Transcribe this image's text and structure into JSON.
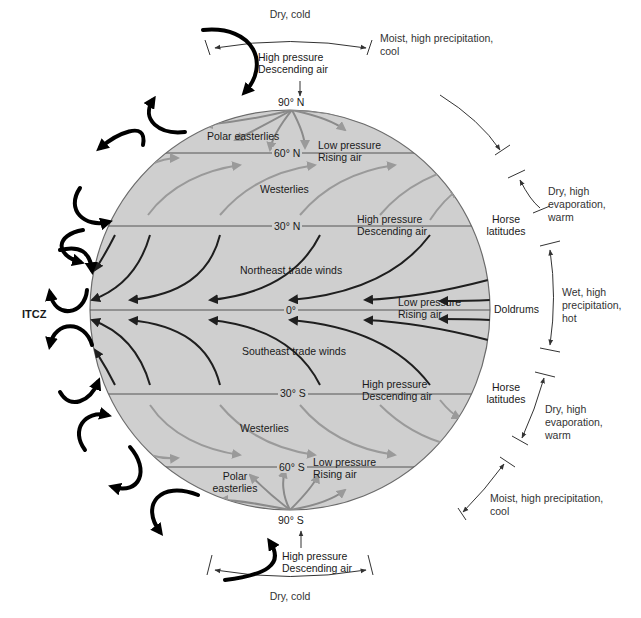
{
  "diagram": {
    "colors": {
      "globe_fill": "#cfcfcf",
      "globe_stroke": "#6b6b6b",
      "trade_wind_arrow": "#1f1f1f",
      "westerly_arrow": "#9a9a9a",
      "cell_arrow": "#000000",
      "background": "#ffffff"
    },
    "latitudes": [
      {
        "id": "90N",
        "label": "90° N"
      },
      {
        "id": "60N",
        "label": "60° N"
      },
      {
        "id": "30N",
        "label": "30° N"
      },
      {
        "id": "eq",
        "label": "0°"
      },
      {
        "id": "30S",
        "label": "30° S"
      },
      {
        "id": "60S",
        "label": "60° S"
      },
      {
        "id": "90S",
        "label": "90° S"
      }
    ],
    "pressure_labels": {
      "north_pole": {
        "line1": "High pressure",
        "line2": "Descending air"
      },
      "n60": {
        "line1": "Low pressure",
        "line2": "Rising air"
      },
      "n30": {
        "line1": "High pressure",
        "line2": "Descending air"
      },
      "equator": {
        "line1": "Low pressure",
        "line2": "Rising air"
      },
      "s30": {
        "line1": "High pressure",
        "line2": "Descending air"
      },
      "s60": {
        "line1": "Low pressure",
        "line2": "Rising air"
      },
      "south_pole": {
        "line1": "High pressure",
        "line2": "Descending air"
      }
    },
    "wind_labels": {
      "polar_easterlies_north": "Polar easterlies",
      "westerlies_north": "Westerlies",
      "ne_trades": "Northeast trade winds",
      "se_trades": "Southeast trade winds",
      "westerlies_south": "Westerlies",
      "polar_easterlies_south_1": "Polar",
      "polar_easterlies_south_2": "easterlies"
    },
    "zone_labels": {
      "itcz": "ITCZ",
      "horse_north_1": "Horse",
      "horse_north_2": "latitudes",
      "doldrums": "Doldrums",
      "horse_south_1": "Horse",
      "horse_south_2": "latitudes"
    },
    "climate_labels": {
      "north_pole": "Dry, cold",
      "north_60": "Moist, high precipitation, cool",
      "north_30": "Dry, high evaporation, warm",
      "equator": "Wet, high precipitation, hot",
      "south_30": "Dry, high evaporation, warm",
      "south_60": "Moist, high precipitation, cool",
      "south_pole": "Dry, cold"
    }
  }
}
